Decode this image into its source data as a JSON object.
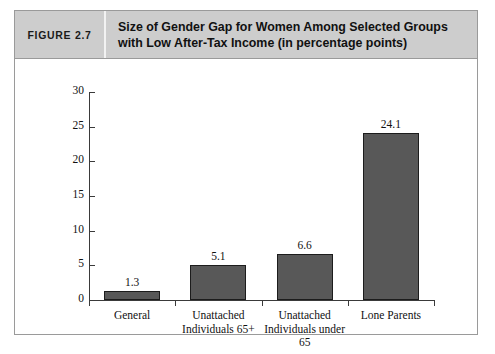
{
  "figure": {
    "number_label": "FIGURE 2.7",
    "title_line1": "Size of Gender Gap for Women Among Selected Groups",
    "title_line2": "with Low After-Tax Income (in percentage points)"
  },
  "colors": {
    "header_background": "#cdcdcd",
    "frame_border": "#9a9a9a",
    "bar_fill": "#585858",
    "bar_border": "#1c1c1c",
    "axis": "#3a3a3a",
    "text": "#111111",
    "page_background": "#ffffff"
  },
  "chart_data": {
    "type": "bar",
    "title": "Size of Gender Gap for Women Among Selected Groups with Low After-Tax Income (in percentage points)",
    "xlabel": "",
    "ylabel": "",
    "categories": [
      "General",
      "Unattached Individuals 65+",
      "Unattached Individuals under 65",
      "Lone Parents"
    ],
    "category_lines": [
      [
        "General"
      ],
      [
        "Unattached",
        "Individuals 65+"
      ],
      [
        "Unattached",
        "Individuals under",
        "65"
      ],
      [
        "Lone Parents"
      ]
    ],
    "values": [
      1.3,
      5.1,
      6.6,
      24.1
    ],
    "value_labels": [
      "1.3",
      "5.1",
      "6.6",
      "24.1"
    ],
    "ylim": [
      0,
      30
    ],
    "yticks": [
      0,
      5,
      10,
      15,
      20,
      25,
      30
    ],
    "ytick_labels": [
      "0",
      "5",
      "10",
      "15",
      "20",
      "25",
      "30"
    ],
    "grid": false,
    "legend": false
  }
}
